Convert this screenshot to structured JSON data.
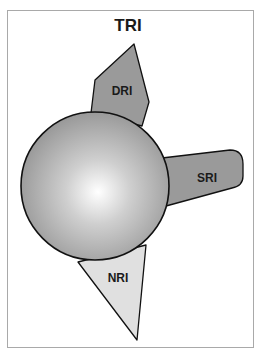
{
  "title": "TRI",
  "regions": [
    {
      "id": "dri",
      "label": "DRI",
      "fill": "#9a9a9a"
    },
    {
      "id": "sri",
      "label": "SRI",
      "fill": "#9a9a9a"
    },
    {
      "id": "nri",
      "label": "NRI",
      "fill": "#e0e0e0"
    }
  ],
  "center_sphere": {
    "fill_light": "#ffffff",
    "fill_dark": "#8c8c8c",
    "stroke": "#111111"
  },
  "colors": {
    "frame_border": "#a9a9a9",
    "outline": "#111111"
  }
}
